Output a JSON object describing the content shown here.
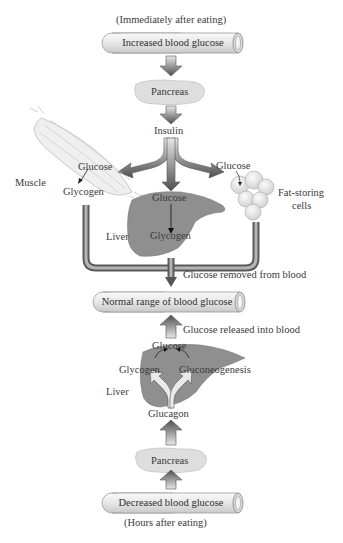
{
  "diagram": {
    "top_caption": "(Immediately after eating)",
    "bottom_caption": "(Hours after eating)",
    "tubes": {
      "increased": "Increased blood glucose",
      "normal": "Normal range of blood glucose",
      "decreased": "Decreased blood glucose"
    },
    "top_section": {
      "pancreas": "Pancreas",
      "hormone": "Insulin",
      "muscle": {
        "label": "Muscle",
        "from": "Glucose",
        "to": "Glycogen"
      },
      "liver": {
        "label": "Liver",
        "from": "Glucose",
        "to": "Glycogen"
      },
      "fat": {
        "label_line1": "Fat-storing",
        "label_line2": "cells",
        "input": "Glucose"
      },
      "result": "Glucose removed from blood"
    },
    "bottom_section": {
      "result": "Glucose released into blood",
      "liver": {
        "label": "Liver",
        "product": "Glucose",
        "source1": "Glycogen",
        "source2": "Gluconeogenesis"
      },
      "hormone": "Glucagon",
      "pancreas": "Pancreas"
    },
    "colors": {
      "arrow_dark": "#5a5a5a",
      "arrow_light": "#d8d8d8",
      "tube_fill": "#ececec",
      "liver": "#8c8c8c",
      "pancreas": "#dcdcdc"
    }
  }
}
